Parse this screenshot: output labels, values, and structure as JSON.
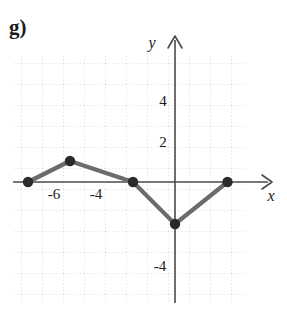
{
  "figure": {
    "part_label": "g)",
    "background_color": "#ffffff",
    "grid_color": "#c9c9d6",
    "axis_color": "#4a4a4a",
    "curve_color": "#6b6b6b",
    "point_color": "#2a2a2a",
    "text_color": "#1c1c1c"
  },
  "axes": {
    "x_label": "x",
    "y_label": "y",
    "x_ticks": [
      {
        "label": "-6",
        "value": -6
      },
      {
        "label": "-4",
        "value": -4
      }
    ],
    "y_ticks": [
      {
        "label": "4",
        "value": 4
      },
      {
        "label": "2",
        "value": 2
      },
      {
        "label": "-4",
        "value": -4
      }
    ]
  },
  "chart_data": {
    "type": "line",
    "title": "",
    "xlabel": "x",
    "ylabel": "y",
    "xlim": [
      -8,
      3.5
    ],
    "ylim": [
      -6,
      6
    ],
    "grid": true,
    "grid_step": 1,
    "legend": "none",
    "series": [
      {
        "name": "piecewise-linear-graph",
        "marker": "filled-circle",
        "points": [
          {
            "x": -7,
            "y": 0
          },
          {
            "x": -5,
            "y": 1
          },
          {
            "x": -2,
            "y": 0
          },
          {
            "x": 0,
            "y": -2
          },
          {
            "x": 2.5,
            "y": 0
          }
        ]
      }
    ]
  }
}
